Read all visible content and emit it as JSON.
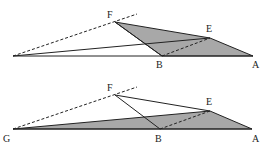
{
  "figure_top": {
    "labels": {
      "F": "F",
      "E": "E",
      "B": "B",
      "A": "A"
    }
  },
  "figure_bottom": {
    "labels": {
      "F": "F",
      "E": "E",
      "G": "G",
      "B": "B",
      "A": "A"
    }
  },
  "colors": {
    "fill": "#a8a8a8",
    "stroke": "#222222"
  }
}
